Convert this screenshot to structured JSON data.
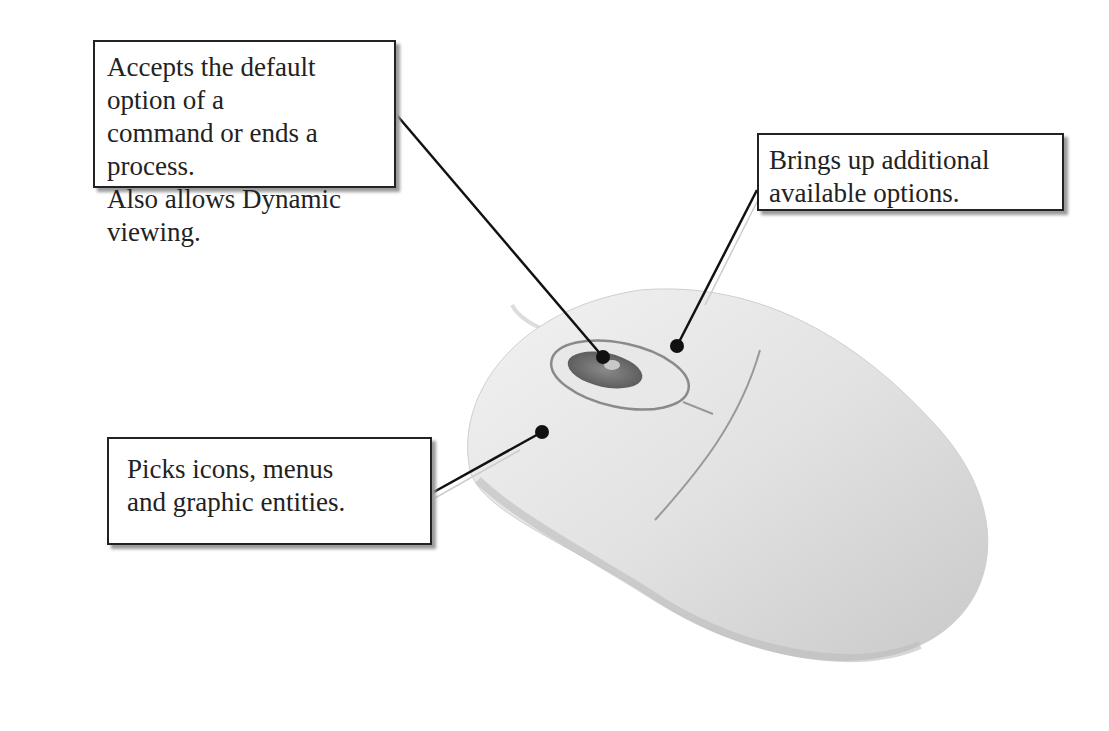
{
  "figure": {
    "callouts": [
      {
        "id": "middle-button",
        "target": "scroll wheel / middle button",
        "lines": [
          "Accepts the default option of a",
          "command or ends a process.",
          "Also allows Dynamic viewing."
        ]
      },
      {
        "id": "right-button",
        "target": "right mouse button",
        "lines": [
          "Brings up additional",
          "available options."
        ]
      },
      {
        "id": "left-button",
        "target": "left mouse button",
        "lines": [
          "Picks icons, menus",
          "and graphic entities."
        ]
      }
    ],
    "colors": {
      "mouse_body": "#e4e4e4",
      "mouse_shadow": "#c8c8c8",
      "wheel": "#6e6e6e",
      "leader_line": "#111111",
      "box_border": "#222222"
    }
  }
}
